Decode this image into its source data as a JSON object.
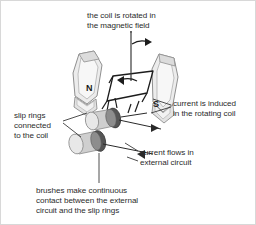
{
  "diagram": {
    "background_color": "#ffffff",
    "text_color": "#2b2b2b",
    "magnet_fill": "#efefef",
    "magnet_stroke": "#8c8c8c",
    "ring_dark": "#4a4a4a",
    "ring_mid": "#9a9a9a",
    "ring_light": "#d9d9d9",
    "labels": {
      "coil_rotated_line1": "the coil is rotated in",
      "coil_rotated_line2": "the magnetic field",
      "current_induced_line1": "current is induced",
      "current_induced_line2": "in the rotating coil",
      "slip_rings_line1": "slip rings",
      "slip_rings_line2": "connected",
      "slip_rings_line3": "to the coil",
      "current_flows_line1": "current flows in",
      "current_flows_line2": "external circuit",
      "brushes_line1": "brushes make continuous",
      "brushes_line2": "contact between the external",
      "brushes_line3": "circuit and the slip rings",
      "pole_north": "N",
      "pole_south": "S"
    }
  }
}
